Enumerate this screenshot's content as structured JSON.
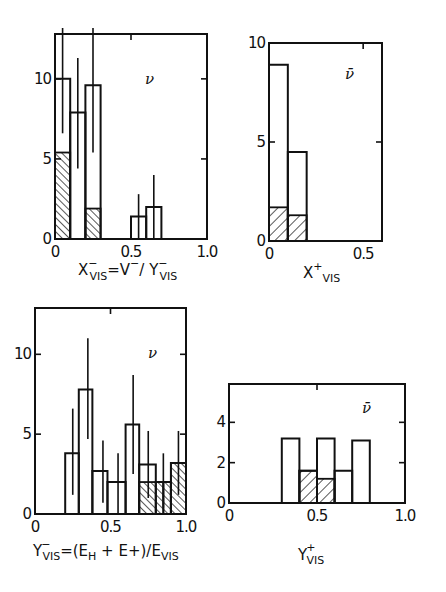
{
  "chart_data": [
    {
      "id": "p1",
      "type": "bar",
      "title": "",
      "annotation": "ν",
      "xlabel": "X⁻VIS = V⁻/ Y⁻VIS",
      "xlabel_parts": {
        "main": "X",
        "sup": "−",
        "sub": "VIS",
        "mid": "=V",
        "mid_sup": "−",
        "tail": "/ Y",
        "tail_sup": "−",
        "tail_sub": "VIS"
      },
      "ylabel": "",
      "xlim": [
        0,
        1.0
      ],
      "ylim": [
        0,
        12.8
      ],
      "xticks": [
        {
          "v": 0,
          "label": "0"
        },
        {
          "v": 0.5,
          "label": "0.5"
        },
        {
          "v": 1.0,
          "label": "1.0"
        }
      ],
      "yticks": [
        {
          "v": 0,
          "label": "0"
        },
        {
          "v": 5,
          "label": "5"
        },
        {
          "v": 10,
          "label": "10"
        }
      ],
      "series": [
        {
          "name": "all events",
          "style": "open",
          "bins": [
            [
              0,
              0.1,
              10.0
            ],
            [
              0.1,
              0.2,
              7.9
            ],
            [
              0.2,
              0.3,
              9.6
            ],
            [
              0.5,
              0.6,
              1.4
            ],
            [
              0.6,
              0.7,
              2.0
            ]
          ]
        },
        {
          "name": "subset",
          "style": "hatched",
          "bins": [
            [
              0,
              0.1,
              5.4
            ],
            [
              0.2,
              0.3,
              1.9
            ]
          ]
        }
      ],
      "errorbars": [
        [
          0.05,
          6.6,
          13.5
        ],
        [
          0.15,
          4.4,
          11.3
        ],
        [
          0.25,
          5.4,
          13.5
        ],
        [
          0.55,
          0,
          2.8
        ],
        [
          0.65,
          0,
          4.0
        ]
      ]
    },
    {
      "id": "p2",
      "type": "bar",
      "title": "",
      "annotation": "ν̄",
      "xlabel": "X⁺VIS",
      "xlabel_parts": {
        "main": "X",
        "sup": "+",
        "sub": "VIS"
      },
      "ylabel": "",
      "xlim": [
        0,
        0.6
      ],
      "ylim": [
        0,
        10
      ],
      "xticks": [
        {
          "v": 0,
          "label": "0"
        },
        {
          "v": 0.5,
          "label": "0.5"
        }
      ],
      "yticks": [
        {
          "v": 0,
          "label": "0"
        },
        {
          "v": 5,
          "label": "5"
        },
        {
          "v": 10,
          "label": "10"
        }
      ],
      "series": [
        {
          "name": "all events",
          "style": "open",
          "bins": [
            [
              0,
              0.1,
              8.9
            ],
            [
              0.1,
              0.2,
              4.5
            ]
          ]
        },
        {
          "name": "subset",
          "style": "hatched",
          "bins": [
            [
              0,
              0.1,
              1.7
            ],
            [
              0.1,
              0.2,
              1.3
            ]
          ]
        }
      ],
      "errorbars": []
    },
    {
      "id": "p3",
      "type": "bar",
      "title": "",
      "annotation": "ν",
      "xlabel": "Y⁻VIS =(EH + E+)/EVIS",
      "xlabel_parts": {
        "main": "Y",
        "sup": "−",
        "sub": "VIS",
        "rest1": "=(E",
        "sub2": "H",
        "rest2": " + E+)/E",
        "sub3": "VIS"
      },
      "ylabel": "",
      "xlim": [
        0,
        1.0
      ],
      "ylim": [
        0,
        12.9
      ],
      "xticks": [
        {
          "v": 0,
          "label": "0"
        },
        {
          "v": 0.5,
          "label": "0.5"
        },
        {
          "v": 1.0,
          "label": "1.0"
        }
      ],
      "yticks": [
        {
          "v": 0,
          "label": "0"
        },
        {
          "v": 5,
          "label": "5"
        },
        {
          "v": 10,
          "label": "10"
        }
      ],
      "series": [
        {
          "name": "all events",
          "style": "open",
          "bins": [
            [
              0.2,
              0.29,
              3.8
            ],
            [
              0.29,
              0.38,
              7.8
            ],
            [
              0.38,
              0.48,
              2.7
            ],
            [
              0.48,
              0.6,
              2.0
            ],
            [
              0.6,
              0.69,
              5.6
            ],
            [
              0.69,
              0.8,
              3.1
            ],
            [
              0.8,
              0.9,
              2.0
            ],
            [
              0.9,
              1.0,
              3.2
            ]
          ]
        },
        {
          "name": "subset",
          "style": "hatched",
          "bins": [
            [
              0.69,
              0.85,
              2.0
            ],
            [
              0.85,
              0.9,
              2.0
            ],
            [
              0.9,
              1.0,
              3.2
            ]
          ]
        }
      ],
      "errorbars": [
        [
          0.25,
          1.2,
          6.6
        ],
        [
          0.35,
          4.7,
          11.0
        ],
        [
          0.45,
          0.7,
          4.6
        ],
        [
          0.55,
          0,
          3.8
        ],
        [
          0.65,
          2.5,
          8.7
        ],
        [
          0.75,
          1.0,
          5.2
        ],
        [
          0.85,
          0.4,
          3.8
        ],
        [
          0.95,
          1.2,
          5.2
        ]
      ]
    },
    {
      "id": "p4",
      "type": "bar",
      "title": "",
      "annotation": "ν̄",
      "xlabel": "Y⁺VIS",
      "xlabel_parts": {
        "main": "Y",
        "sup": "+",
        "sub": "VIS"
      },
      "ylabel": "",
      "xlim": [
        0,
        1.0
      ],
      "ylim": [
        0,
        5.9
      ],
      "xticks": [
        {
          "v": 0,
          "label": "0"
        },
        {
          "v": 0.5,
          "label": "0.5"
        },
        {
          "v": 1.0,
          "label": "1.0"
        }
      ],
      "yticks": [
        {
          "v": 0,
          "label": "0"
        },
        {
          "v": 2,
          "label": "2"
        },
        {
          "v": 4,
          "label": "4"
        }
      ],
      "series": [
        {
          "name": "all events",
          "style": "open",
          "bins": [
            [
              0.3,
              0.4,
              3.2
            ],
            [
              0.4,
              0.5,
              1.6
            ],
            [
              0.5,
              0.6,
              3.2
            ],
            [
              0.6,
              0.7,
              1.6
            ],
            [
              0.7,
              0.8,
              3.1
            ]
          ]
        },
        {
          "name": "subset",
          "style": "hatched",
          "bins": [
            [
              0.4,
              0.5,
              1.6
            ],
            [
              0.5,
              0.6,
              1.2
            ]
          ]
        }
      ],
      "errorbars": []
    }
  ]
}
